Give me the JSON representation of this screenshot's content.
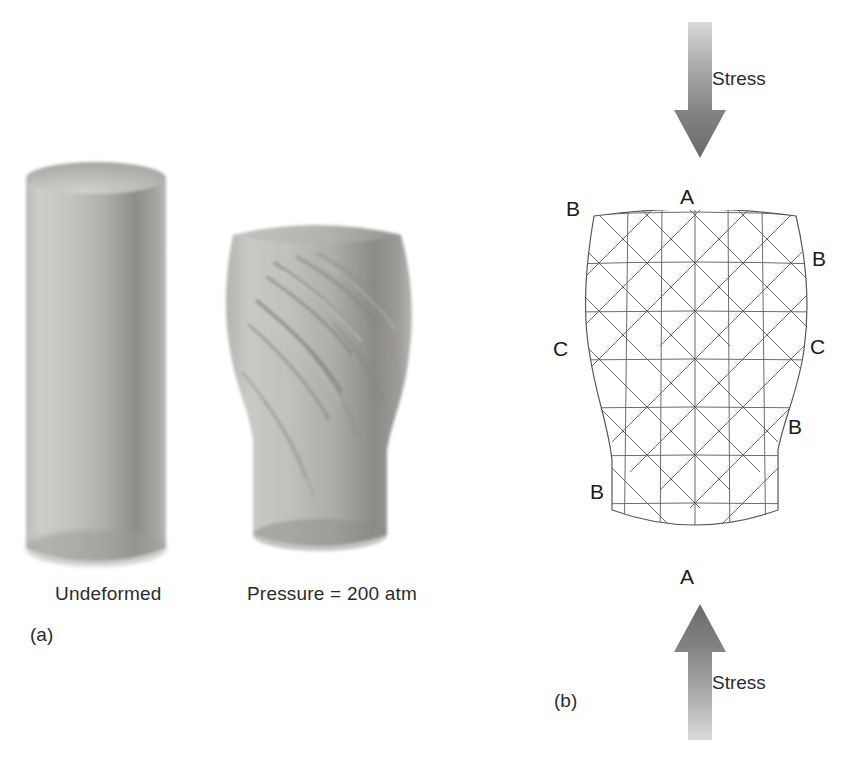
{
  "figure": {
    "panel_a": {
      "id_label": "(a)",
      "captions": [
        {
          "text": "Undeformed",
          "x": 55,
          "y": 583
        },
        {
          "text": "Pressure = 200 atm",
          "x": 247,
          "y": 583
        }
      ],
      "specimens": [
        {
          "name": "undeformed-cylinder",
          "state": "undeformed"
        },
        {
          "name": "deformed-cylinder",
          "state": "deformed",
          "pressure": "200 atm"
        }
      ]
    },
    "panel_b": {
      "id_label": "(b)",
      "arrows": [
        {
          "name": "stress-arrow-top",
          "direction": "down",
          "label": "Stress",
          "label_x": 712,
          "label_y": 78
        },
        {
          "name": "stress-arrow-bottom",
          "direction": "up",
          "label": "Stress",
          "label_x": 712,
          "label_y": 682
        }
      ],
      "grid_labels": [
        {
          "text": "A",
          "x": 680,
          "y": 188,
          "position": "top-center"
        },
        {
          "text": "B",
          "x": 566,
          "y": 200,
          "position": "top-left"
        },
        {
          "text": "B",
          "x": 812,
          "y": 250,
          "position": "upper-right"
        },
        {
          "text": "C",
          "x": 553,
          "y": 340,
          "position": "mid-left"
        },
        {
          "text": "C",
          "x": 810,
          "y": 338,
          "position": "mid-right"
        },
        {
          "text": "B",
          "x": 788,
          "y": 418,
          "position": "lower-right"
        },
        {
          "text": "B",
          "x": 590,
          "y": 483,
          "position": "lower-left"
        },
        {
          "text": "A",
          "x": 680,
          "y": 568,
          "position": "bottom-center"
        }
      ]
    }
  },
  "colors": {
    "background": "#ffffff",
    "text": "#2b2b2b",
    "grid_line": "#595959",
    "outline": "#4d4d4d",
    "specimen_light": "#d8d6d2",
    "specimen_mid": "#b0aeaa",
    "specimen_dark": "#7d7b78",
    "arrow_light": "#cfcfcf",
    "arrow_dark": "#6e6e6e"
  }
}
